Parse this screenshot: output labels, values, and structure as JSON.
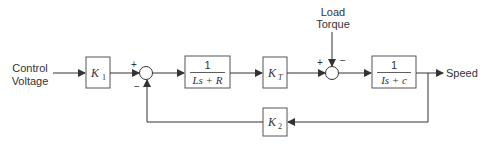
{
  "diagram": {
    "type": "control-system-block-diagram",
    "input": {
      "label_line1": "Control",
      "label_line2": "Voltage"
    },
    "disturbance": {
      "label_line1": "Load",
      "label_line2": "Torque"
    },
    "output": {
      "label": "Speed"
    },
    "blocks": [
      {
        "id": "k1",
        "gain_main": "K",
        "gain_sub": "1"
      },
      {
        "id": "electrical",
        "numerator": "1",
        "denominator": "Ls + R"
      },
      {
        "id": "kt",
        "gain_main": "K",
        "gain_sub": "T"
      },
      {
        "id": "mechanical",
        "numerator": "1",
        "denominator": "Is + c"
      },
      {
        "id": "k2",
        "gain_main": "K",
        "gain_sub": "2"
      }
    ],
    "summing_junctions": [
      {
        "id": "sum1",
        "top_sign": "+",
        "bottom_sign": "−"
      },
      {
        "id": "sum2",
        "left_sign": "+",
        "top_sign": "−"
      }
    ],
    "colors": {
      "line": "#333333",
      "box": "#555555",
      "background": "#ffffff"
    }
  }
}
